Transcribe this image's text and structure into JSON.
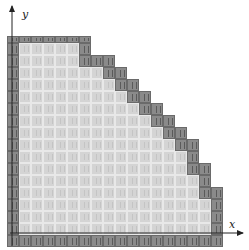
{
  "figure": {
    "axes": {
      "x_label": "x",
      "y_label": "y"
    },
    "colors": {
      "interior_fill": "#d4d4d4",
      "boundary_fill": "#8a8a8a",
      "axis": "#222222"
    },
    "grid": {
      "origin_px": [
        7,
        247
      ],
      "cell_px": 12,
      "columns": 17,
      "column_heights_rows": [
        18,
        18,
        18,
        18,
        18,
        18,
        18,
        16,
        16,
        15,
        14,
        13,
        12,
        11,
        10,
        9,
        7,
        5
      ]
    }
  }
}
